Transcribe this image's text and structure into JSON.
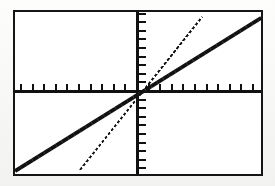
{
  "screen": {
    "title": "Graphing calculator viewing window",
    "width": 275,
    "height": 186,
    "background_color": "#fbfbfa",
    "frame_color": "#151515",
    "plot_background_color": "#ffffff"
  },
  "frame": {
    "left": 13,
    "top": 10,
    "width": 250,
    "height": 166,
    "border_width": 2
  },
  "axes": {
    "color": "#111111",
    "x_axis": {
      "label": "x-axis",
      "y_position_px": 78,
      "thickness_px": 3,
      "tick_spacing_px": 11.6,
      "tick_length_px": 7,
      "tick_count_left": 10,
      "tick_count_right": 10
    },
    "y_axis": {
      "label": "y-axis",
      "x_position_px": 121,
      "thickness_px": 3,
      "tick_spacing_px": 8.6,
      "tick_length_px": 7,
      "tick_count_up": 9,
      "tick_count_down": 9
    },
    "origin_px": {
      "x": 121,
      "y": 78
    }
  },
  "chart_data": {
    "type": "line",
    "title": "Two linear functions through the origin",
    "xlabel": "x",
    "ylabel": "y",
    "grid": false,
    "legend": "none",
    "xlim": [
      -10.4,
      10.8
    ],
    "ylim": [
      -9.1,
      9.1
    ],
    "xticks": [
      -10,
      -9,
      -8,
      -7,
      -6,
      -5,
      -4,
      -3,
      -2,
      -1,
      1,
      2,
      3,
      4,
      5,
      6,
      7,
      8,
      9,
      10
    ],
    "yticks": [
      -9,
      -8,
      -7,
      -6,
      -5,
      -4,
      -3,
      -2,
      -1,
      1,
      2,
      3,
      4,
      5,
      6,
      7,
      8,
      9
    ],
    "series": [
      {
        "name": "thick-line",
        "style": "thick-solid",
        "color": "#111111",
        "thickness_px": 4,
        "slope": 0.55,
        "intercept": 0,
        "x": [
          -10.4,
          10.8
        ],
        "y": [
          -5.7,
          5.9
        ],
        "clipped": false,
        "endpoints_px": [
          {
            "x": 0,
            "y": 159
          },
          {
            "x": 246,
            "y": 6
          }
        ]
      },
      {
        "name": "thin-dotted-line",
        "style": "thin-dotted",
        "color": "#111111",
        "thickness_px": 2,
        "slope": 1.2,
        "intercept": 0,
        "x": [
          -4.9,
          5.5
        ],
        "y": [
          -5.9,
          6.6
        ],
        "clipped": true,
        "endpoints_px": [
          {
            "x": 65,
            "y": 158
          },
          {
            "x": 187,
            "y": 5
          }
        ]
      }
    ]
  }
}
